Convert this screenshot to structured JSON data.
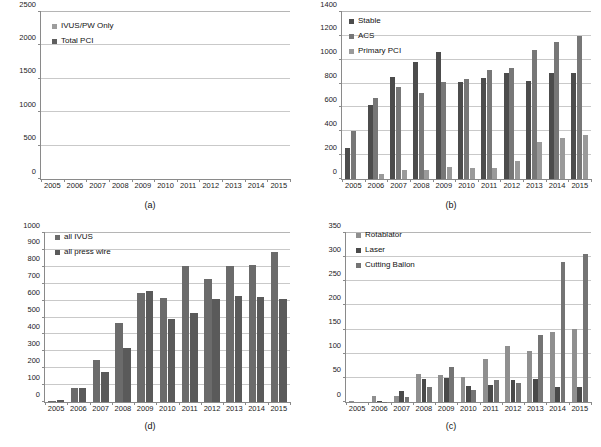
{
  "figure": {
    "panels": [
      "a",
      "b",
      "c",
      "d"
    ]
  },
  "panel_a": {
    "caption": "(a)",
    "legend": [
      {
        "label": "IVUS/PW Only",
        "color": "#9d9d9d"
      },
      {
        "label": "Total PCI",
        "color": "#5e5e5e"
      }
    ],
    "yticks": [
      "0",
      "500",
      "1000",
      "1500",
      "2000",
      "2500"
    ],
    "xlabels": [
      "2005",
      "2006",
      "2007",
      "2008",
      "2009",
      "2010",
      "2011",
      "2012",
      "2013",
      "2014",
      "2015"
    ]
  },
  "panel_b": {
    "caption": "(b)",
    "legend": [
      {
        "label": "Stable",
        "color": "#4c4c4c"
      },
      {
        "label": "ACS",
        "color": "#777777"
      },
      {
        "label": "Primary PCI",
        "color": "#9a9a9a"
      }
    ],
    "yticks": [
      "0",
      "200",
      "400",
      "600",
      "800",
      "1000",
      "1200",
      "1400"
    ],
    "xlabels": [
      "2005",
      "2006",
      "2007",
      "2008",
      "2009",
      "2010",
      "2011",
      "2012",
      "2013",
      "2014",
      "2015"
    ]
  },
  "panel_c": {
    "caption": "(c)",
    "legend": [
      {
        "label": "Rotablator",
        "color": "#8f8f8f"
      },
      {
        "label": "Laser",
        "color": "#4a4a4a"
      },
      {
        "label": "Cutting Ballon",
        "color": "#747474"
      }
    ],
    "yticks": [
      "0",
      "50",
      "100",
      "150",
      "200",
      "250",
      "300",
      "350"
    ],
    "xlabels": [
      "2005",
      "2006",
      "2007",
      "2008",
      "2009",
      "2010",
      "2011",
      "2012",
      "2013",
      "2014",
      "2015"
    ]
  },
  "panel_d": {
    "caption": "(d)",
    "legend": [
      {
        "label": "all IVUS",
        "color": "#6b6b6b"
      },
      {
        "label": "all press wire",
        "color": "#5a5a5a"
      }
    ],
    "yticks": [
      "0",
      "100",
      "200",
      "300",
      "400",
      "500",
      "600",
      "700",
      "800",
      "900",
      "1000"
    ],
    "xlabels": [
      "2005",
      "2006",
      "2007",
      "2008",
      "2009",
      "2010",
      "2011",
      "2012",
      "2013",
      "2014",
      "2015"
    ]
  },
  "chart_data": [
    {
      "panel": "a",
      "type": "bar",
      "stacked": true,
      "title": "(a)",
      "xlabel": "",
      "ylabel": "",
      "ylim": [
        0,
        2500
      ],
      "ytick_step": 500,
      "grid": true,
      "legend_position": "top-left",
      "categories": [
        "2005",
        "2006",
        "2007",
        "2008",
        "2009",
        "2010",
        "2011",
        "2012",
        "2013",
        "2014",
        "2015"
      ],
      "series": [
        {
          "name": "Total PCI",
          "color": "#5e5e5e",
          "values": [
            660,
            1280,
            1600,
            1690,
            1860,
            1610,
            1745,
            1790,
            1870,
            2020,
            2060
          ]
        },
        {
          "name": "IVUS/PW Only",
          "color": "#9d9d9d",
          "values": [
            10,
            55,
            75,
            240,
            400,
            370,
            385,
            385,
            365,
            405,
            370
          ]
        }
      ],
      "totals": [
        670,
        1335,
        1675,
        1930,
        2260,
        1980,
        2130,
        2175,
        2235,
        2425,
        2430
      ]
    },
    {
      "panel": "b",
      "type": "bar",
      "stacked": false,
      "title": "(b)",
      "xlabel": "",
      "ylabel": "",
      "ylim": [
        0,
        1400
      ],
      "ytick_step": 200,
      "grid": true,
      "legend_position": "top-left",
      "categories": [
        "2005",
        "2006",
        "2007",
        "2008",
        "2009",
        "2010",
        "2011",
        "2012",
        "2013",
        "2014",
        "2015"
      ],
      "series": [
        {
          "name": "Stable",
          "color": "#4c4c4c",
          "values": [
            260,
            620,
            855,
            980,
            1065,
            810,
            845,
            885,
            820,
            885,
            890
          ]
        },
        {
          "name": "ACS",
          "color": "#777777",
          "values": [
            400,
            680,
            770,
            720,
            810,
            835,
            915,
            930,
            1085,
            1150,
            1195
          ]
        },
        {
          "name": "Primary PCI",
          "color": "#9a9a9a",
          "values": [
            0,
            40,
            75,
            75,
            100,
            95,
            90,
            150,
            310,
            345,
            370
          ]
        }
      ]
    },
    {
      "panel": "c",
      "type": "bar",
      "stacked": false,
      "title": "(c)",
      "xlabel": "",
      "ylabel": "",
      "ylim": [
        0,
        350
      ],
      "ytick_step": 50,
      "grid": true,
      "legend_position": "top-left",
      "categories": [
        "2005",
        "2006",
        "2007",
        "2008",
        "2009",
        "2010",
        "2011",
        "2012",
        "2013",
        "2014",
        "2015"
      ],
      "series": [
        {
          "name": "Rotablator",
          "color": "#8f8f8f",
          "values": [
            2,
            12,
            13,
            58,
            56,
            52,
            90,
            117,
            105,
            145,
            151
          ]
        },
        {
          "name": "Laser",
          "color": "#4a4a4a",
          "values": [
            0,
            3,
            22,
            48,
            50,
            33,
            35,
            46,
            47,
            31,
            31
          ]
        },
        {
          "name": "Cutting Ballon",
          "color": "#747474",
          "values": [
            0,
            1,
            10,
            31,
            73,
            24,
            45,
            40,
            138,
            291,
            307
          ]
        }
      ]
    },
    {
      "panel": "d",
      "type": "bar",
      "stacked": false,
      "title": "(d)",
      "xlabel": "",
      "ylabel": "",
      "ylim": [
        0,
        1000
      ],
      "ytick_step": 100,
      "grid": true,
      "legend_position": "top-left",
      "categories": [
        "2005",
        "2006",
        "2007",
        "2008",
        "2009",
        "2010",
        "2011",
        "2012",
        "2013",
        "2014",
        "2015"
      ],
      "series": [
        {
          "name": "all IVUS",
          "color": "#6b6b6b",
          "values": [
            5,
            80,
            247,
            467,
            645,
            617,
            803,
            728,
            803,
            812,
            888
          ]
        },
        {
          "name": "all press wire",
          "color": "#5a5a5a",
          "values": [
            10,
            82,
            176,
            318,
            658,
            490,
            527,
            610,
            626,
            621,
            610
          ]
        }
      ]
    }
  ]
}
